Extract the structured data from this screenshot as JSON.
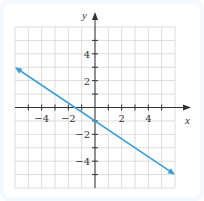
{
  "chart_data": {
    "type": "line",
    "title": "",
    "xlabel": "x",
    "ylabel": "y",
    "xlim": [
      -6,
      6
    ],
    "ylim": [
      -6,
      6
    ],
    "grid": true,
    "x_tick_labels": [
      "-4",
      "-2",
      "2",
      "4"
    ],
    "x_tick_values": [
      -4,
      -2,
      2,
      4
    ],
    "y_tick_labels": [
      "4",
      "2",
      "-2",
      "-4"
    ],
    "y_tick_values": [
      4,
      2,
      -2,
      -4
    ],
    "series": [
      {
        "name": "line",
        "equation": "y = -2/3 x - 1",
        "x": [
          -6,
          6
        ],
        "y": [
          3,
          -5
        ],
        "arrows_both_ends": true,
        "color": "#3a9fd6"
      }
    ]
  },
  "axes": {
    "x_label": "x",
    "y_label": "y"
  },
  "colors": {
    "line": "#3a9fd6",
    "grid": "#d4d4d4",
    "axis": "#333333",
    "panel": "#f3f9fd"
  }
}
